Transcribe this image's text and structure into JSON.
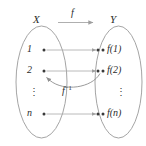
{
  "figure": {
    "kind": "set-mapping-diagram",
    "colors": {
      "stroke": "#9a9a9a",
      "arrow": "#a6a6a6",
      "text": "#2b2b2b",
      "dot": "#3a3a3a",
      "background": "#ffffff"
    }
  },
  "domain_set": {
    "name": "X",
    "elements": [
      {
        "label": "1"
      },
      {
        "label": "2"
      },
      {
        "label": "⋮"
      },
      {
        "label": "n"
      }
    ]
  },
  "codomain_set": {
    "name": "Y",
    "elements": [
      {
        "label": "f(1)"
      },
      {
        "label": "f(2)"
      },
      {
        "label": "⋮"
      },
      {
        "label": "f(n)"
      }
    ]
  },
  "maps": {
    "forward": {
      "label": "f",
      "superscript": ""
    },
    "inverse": {
      "label": "f",
      "superscript": "−1"
    }
  }
}
